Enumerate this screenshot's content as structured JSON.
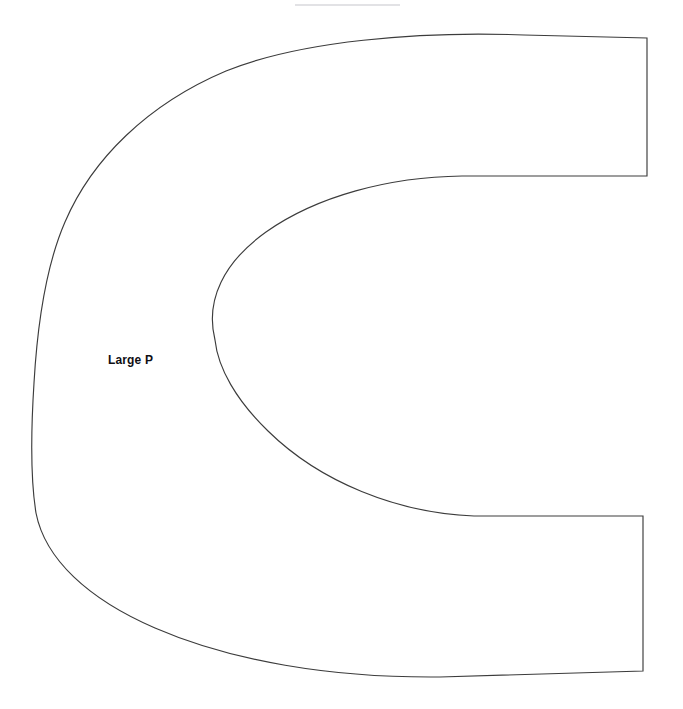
{
  "document": {
    "title": "Large P template",
    "background_color": "#ffffff",
    "width": 683,
    "height": 709
  },
  "drawing": {
    "name": "large-p-outline",
    "description": "Open C-shaped / horseshoe pattern piece outline with two straight right-hand arms",
    "stroke_color": "#3c3c3c",
    "stroke_width": 1.15,
    "fill_color": "#ffffff",
    "outline_path": "M 647 38 L 647 176 L 462 176 C 389 177 317 196 266 232 C 224 262 205 300 215 340 C 218 368 236 400 268 431 C 320 482 397 513 474 516 L 643 516 L 643 671 L 440 677 C 331 678 231 661 155 628 C 88 599 45 559 36 513 C 31 482 31 430 34 383 C 37 331 45 268 65 222 C 92 159 148 104 226 71 C 300 41 419 31 524 35 Z",
    "labels": [
      {
        "name": "large-p-label",
        "text": "Large P",
        "x": 108,
        "y": 353
      }
    ],
    "artifacts": [
      {
        "name": "page-artifact-line",
        "x1": 295,
        "y1": 5,
        "x2": 400,
        "y2": 5,
        "color": "#d9d9dc"
      }
    ]
  }
}
